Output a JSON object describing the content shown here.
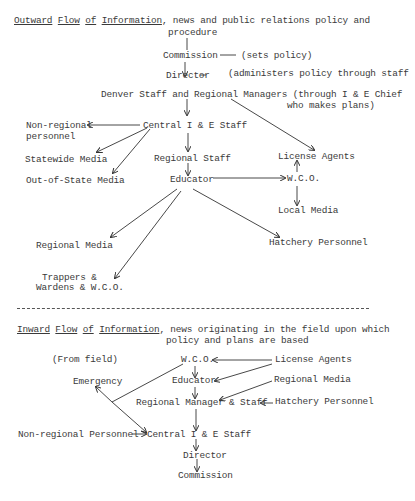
{
  "outward": {
    "heading": {
      "w1": "Outward",
      "w2": "Flow",
      "w3": "of",
      "w4": "Information",
      "rest": ", news and public relations policy and",
      "line2": "procedure"
    },
    "nodes": {
      "commission": "Commission",
      "commission_note": "(sets policy)",
      "director": "Director",
      "director_note": "(administers policy through staff",
      "denver": "Denver Staff and Regional Managers (through I & E Chief",
      "denver_line2": "who makes plans)",
      "central": "Central I & E Staff",
      "nonregional_1": "Non-regional",
      "nonregional_2": "personnel",
      "statewide": "Statewide Media",
      "outofstate": "Out-of-State Media",
      "regional_staff": "Regional Staff",
      "educator": "Educator",
      "license_agents": "License Agents",
      "wco": "W.C.O.",
      "local_media": "Local Media",
      "regional_media": "Regional Media",
      "hatchery": "Hatchery Personnel",
      "trappers_1": "Trappers &",
      "trappers_2": "Wardens & W.C.O."
    }
  },
  "inward": {
    "heading": {
      "w1": "Inward",
      "w2": "Flow",
      "w3": "of",
      "w4": "Information",
      "rest": ", news originating in the field upon which",
      "line2": "policy and plans are based"
    },
    "nodes": {
      "from_field": "(From field)",
      "wco": "W.C.O.",
      "license_agents": "License Agents",
      "emergency": "Emergency",
      "educator": "Educator",
      "regional_media": "Regional Media",
      "regional_manager": "Regional Manager & Staff",
      "hatchery": "Hatchery Personnel",
      "nonregional": "Non-regional Personnel",
      "central": "Central I & E Staff",
      "director": "Director",
      "commission": "Commission"
    }
  }
}
